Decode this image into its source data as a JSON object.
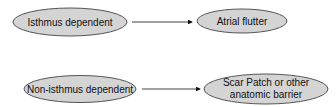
{
  "diagram": {
    "type": "flow",
    "fill_color": "#d4d4d4",
    "stroke_color": "#555555",
    "nodes": [
      {
        "id": "isthmus",
        "label": "Isthmus dependent"
      },
      {
        "id": "flutter",
        "label": "Atrial flutter"
      },
      {
        "id": "non_isthmus",
        "label": "Non-isthmus dependent"
      },
      {
        "id": "scar",
        "label_line1": "Scar Patch or other",
        "label_line2": "anatomic barrier"
      }
    ],
    "edges": [
      {
        "from": "isthmus",
        "to": "flutter"
      },
      {
        "from": "non_isthmus",
        "to": "scar"
      }
    ]
  }
}
